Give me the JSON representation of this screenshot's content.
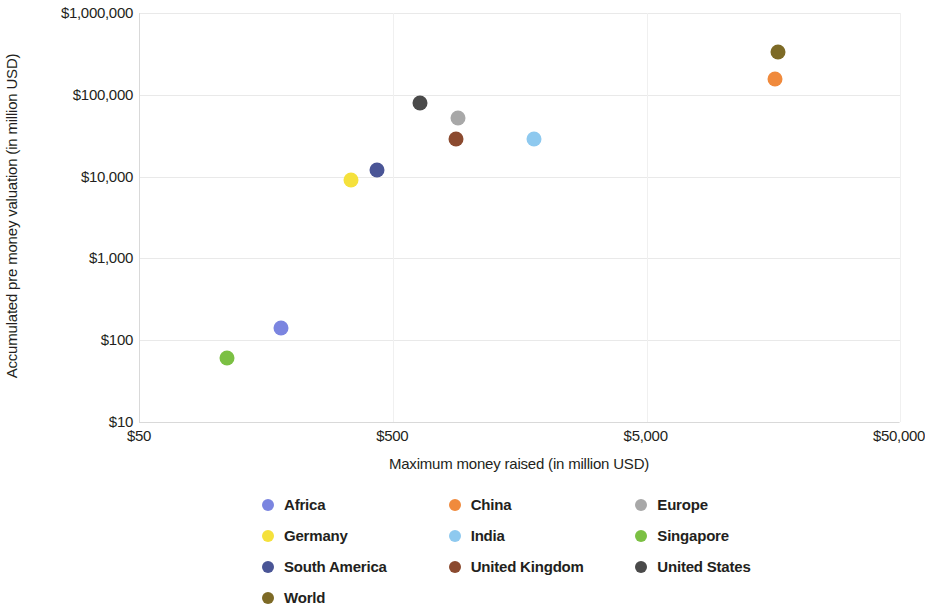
{
  "chart_data": {
    "type": "scatter",
    "title": "",
    "xlabel": "Maximum money raised (in million USD)",
    "ylabel": "Accumulated pre money valuation (in million USD)",
    "xscale": "log",
    "yscale": "log",
    "xlim": [
      50,
      50000
    ],
    "ylim": [
      10,
      1000000
    ],
    "xticks": [
      "$50",
      "$500",
      "$5,000",
      "$50,000"
    ],
    "xtick_values": [
      50,
      500,
      5000,
      50000
    ],
    "yticks": [
      "$10",
      "$100",
      "$1,000",
      "$10,000",
      "$100,000",
      "$1,000,000"
    ],
    "ytick_values": [
      10,
      100,
      1000,
      10000,
      100000,
      1000000
    ],
    "grid": true,
    "legend_position": "bottom",
    "series": [
      {
        "name": "Africa",
        "color": "#7b85e0",
        "x": 180,
        "y": 140
      },
      {
        "name": "China",
        "color": "#f08a3c",
        "x": 16000,
        "y": 155000
      },
      {
        "name": "Europe",
        "color": "#a8a8a8",
        "x": 900,
        "y": 52000
      },
      {
        "name": "Germany",
        "color": "#f5e13c",
        "x": 340,
        "y": 9000
      },
      {
        "name": "India",
        "color": "#8ec9ef",
        "x": 1800,
        "y": 29000
      },
      {
        "name": "Singapore",
        "color": "#7bc043",
        "x": 110,
        "y": 60
      },
      {
        "name": "South America",
        "color": "#4a5596",
        "x": 430,
        "y": 12000
      },
      {
        "name": "United Kingdom",
        "color": "#8b4a2f",
        "x": 880,
        "y": 29000
      },
      {
        "name": "United States",
        "color": "#4a4a4a",
        "x": 640,
        "y": 80000
      },
      {
        "name": "World",
        "color": "#7d6a26",
        "x": 16500,
        "y": 330000
      }
    ]
  },
  "legend": {
    "rows": [
      [
        "Africa",
        "China",
        "Europe"
      ],
      [
        "Germany",
        "India",
        "Singapore"
      ],
      [
        "South America",
        "United Kingdom",
        "United States"
      ],
      [
        "World"
      ]
    ]
  }
}
